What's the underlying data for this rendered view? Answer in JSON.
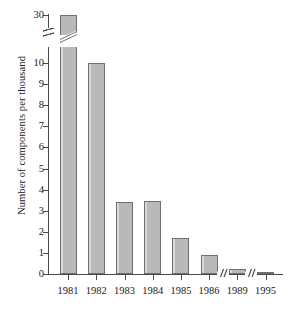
{
  "chart_data": {
    "type": "bar",
    "title": "",
    "subtitle": "",
    "xlabel": "",
    "ylabel": "Number of components per thousand",
    "categories": [
      "1981",
      "1982",
      "1983",
      "1984",
      "1985",
      "1986",
      "1989",
      "1995"
    ],
    "values": [
      30,
      10,
      3.4,
      3.45,
      1.7,
      0.9,
      0.25,
      0.07
    ],
    "ylim": [
      0,
      10
    ],
    "y_tick_labels": [
      "0",
      "1",
      "2",
      "3",
      "4",
      "5",
      "6",
      "7",
      "8",
      "9",
      "10",
      "30"
    ],
    "y_axis_break": {
      "present": true,
      "between": [
        10,
        30
      ],
      "note": "axis broken between 10 and 30; the 1981 bar is drawn across the break"
    },
    "x_axis_breaks": [
      {
        "after": "1986",
        "before": "1989"
      },
      {
        "after": "1989",
        "before": "1995"
      }
    ],
    "grid": false,
    "legend": false,
    "bar_fill_color": "#b9b9b9",
    "bar_edge_color": "#707070",
    "axis_color": "#4a4a4a",
    "background_color": "#ffffff"
  }
}
